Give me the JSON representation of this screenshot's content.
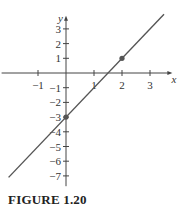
{
  "chart_data": {
    "type": "line",
    "title": "",
    "xlabel": "x",
    "ylabel": "y",
    "xlim": [
      -2.3,
      3.8
    ],
    "ylim": [
      -7.7,
      3.9
    ],
    "grid": false,
    "legend": null,
    "x_ticks": [
      -1,
      1,
      2,
      3
    ],
    "x_tick_labels": [
      "−1",
      "1",
      "2",
      "3"
    ],
    "y_ticks": [
      3,
      2,
      1,
      -1,
      -2,
      -3,
      -4,
      -5,
      -6,
      -7
    ],
    "y_tick_labels": [
      "3",
      "2",
      "1",
      "−1",
      "−2",
      "−3",
      "−4",
      "−5",
      "−6",
      "−7"
    ],
    "series": [
      {
        "name": "line",
        "equation": "y = 2x - 3",
        "x": [
          -2.05,
          3.5
        ],
        "y": [
          -7.1,
          4.0
        ]
      }
    ],
    "points": [
      {
        "x": 0,
        "y": -3
      },
      {
        "x": 2,
        "y": 1
      }
    ]
  },
  "caption": "FIGURE 1.20",
  "colors": {
    "axis": "#444444",
    "line": "#555555",
    "point": "#555555",
    "text": "#333333"
  }
}
